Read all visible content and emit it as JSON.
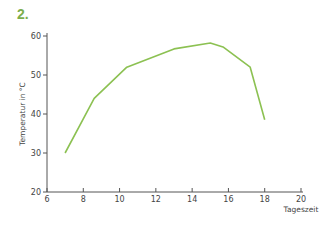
{
  "figure_label": "2.",
  "colors": {
    "line": "#8cc152",
    "label": "#7cae4c",
    "axis": "#555555"
  },
  "chart_data": {
    "type": "line",
    "title": "",
    "xlabel": "Tageszeit",
    "ylabel": "Temperatur in °C",
    "xlim": [
      6,
      20
    ],
    "ylim": [
      20,
      60
    ],
    "xticks": [
      6,
      8,
      10,
      12,
      14,
      16,
      18,
      20
    ],
    "yticks": [
      20,
      30,
      40,
      50,
      60
    ],
    "grid": false,
    "legend": null,
    "series": [
      {
        "name": "Temperatur",
        "x": [
          7,
          8.6,
          10.4,
          13,
          15,
          15.7,
          17.2,
          18
        ],
        "y": [
          30,
          44,
          52,
          56.7,
          58.2,
          57.2,
          52,
          38.5
        ]
      }
    ]
  }
}
